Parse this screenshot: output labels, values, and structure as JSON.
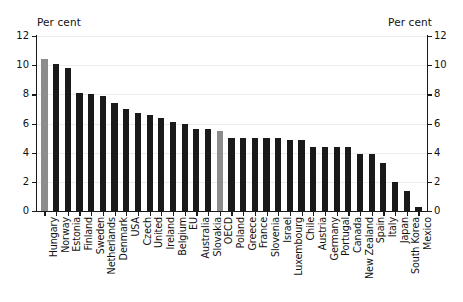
{
  "axis": {
    "left_caption": "Per cent",
    "right_caption": "Per cent",
    "ticks": [
      "0",
      "2",
      "4",
      "6",
      "8",
      "10",
      "12"
    ]
  },
  "chart_data": {
    "type": "bar",
    "title": "",
    "subtitle": "",
    "xlabel": "",
    "ylabel": "Per cent",
    "ylim": [
      0,
      12
    ],
    "yticks": [
      0,
      2,
      4,
      6,
      8,
      10,
      12
    ],
    "grid": true,
    "legend": "none",
    "highlight_color": "#8c8c8c",
    "bar_color": "#1a1a1a",
    "highlighted": [
      "Hungary",
      "OECD"
    ],
    "categories": [
      "Hungary",
      "Norway",
      "Estonia",
      "Finland",
      "Sweden",
      "Netherlands",
      "Denmark",
      "USA",
      "Czech",
      "United",
      "Ireland",
      "Belgium",
      "EU",
      "Australia",
      "Slovakia",
      "OECD",
      "Poland",
      "Greece",
      "France",
      "Slovenia",
      "Israel",
      "Luxembourg",
      "Chile",
      "Austria",
      "Germany",
      "Portugal",
      "Canada",
      "New Zealand",
      "Spain",
      "Italy",
      "Japan",
      "South Korea",
      "Mexico"
    ],
    "values": [
      10.4,
      10.1,
      9.8,
      8.1,
      8.0,
      7.9,
      7.4,
      7.0,
      6.7,
      6.6,
      6.4,
      6.1,
      6.0,
      5.6,
      5.6,
      5.5,
      5.0,
      5.0,
      5.0,
      5.0,
      5.0,
      4.9,
      4.9,
      4.4,
      4.4,
      4.4,
      4.4,
      3.9,
      3.9,
      3.3,
      2.0,
      1.4,
      0.3
    ]
  }
}
